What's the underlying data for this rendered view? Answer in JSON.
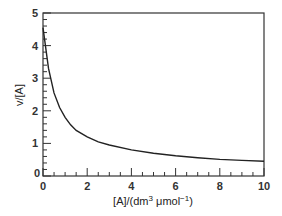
{
  "chart_data": {
    "type": "line",
    "title": "",
    "xlabel": "[A]/(dm³ μmol⁻¹)",
    "xlabel_parts": {
      "main": "[A]/(dm",
      "sup1": "3",
      "mid": " μmol",
      "sup2": "−1",
      "end": ")"
    },
    "ylabel": "v/[A]",
    "xlim": [
      0,
      10
    ],
    "ylim": [
      0,
      5
    ],
    "x_ticks": [
      "0",
      "2",
      "4",
      "6",
      "8",
      "10"
    ],
    "y_ticks": [
      "0",
      "1",
      "2",
      "3",
      "4",
      "5"
    ],
    "grid": false,
    "legend": null,
    "series": [
      {
        "name": "v/[A]",
        "x": [
          0,
          0.25,
          0.5,
          0.75,
          1.0,
          1.25,
          1.5,
          2,
          2.5,
          3,
          4,
          5,
          6,
          7,
          8,
          9,
          10
        ],
        "values": [
          4.55,
          3.3,
          2.55,
          2.1,
          1.8,
          1.57,
          1.4,
          1.2,
          1.05,
          0.95,
          0.8,
          0.7,
          0.62,
          0.56,
          0.51,
          0.48,
          0.45
        ]
      }
    ]
  }
}
